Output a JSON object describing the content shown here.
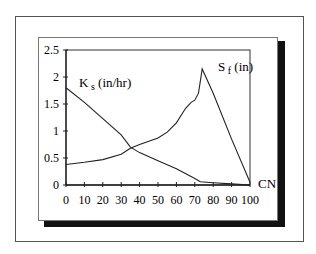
{
  "chart_data": {
    "type": "line",
    "title": "",
    "xlabel": "CN",
    "ylabel": "",
    "xlim": [
      0,
      100
    ],
    "ylim": [
      0,
      2.5
    ],
    "x_ticks": [
      "0",
      "10",
      "20",
      "30",
      "40",
      "50",
      "60",
      "70",
      "80",
      "90",
      "100"
    ],
    "y_ticks": [
      "0",
      "0.5",
      "1",
      "1.5",
      "2",
      "2.5"
    ],
    "grid": false,
    "legend": "inline labels",
    "series": [
      {
        "name": "Ks (in/hr)",
        "label_main": "K",
        "label_sub": "s",
        "label_unit": "(in/hr)",
        "x": [
          0,
          10,
          20,
          30,
          35,
          40,
          50,
          60,
          70,
          73,
          80,
          90,
          100
        ],
        "values": [
          1.8,
          1.53,
          1.23,
          0.93,
          0.7,
          0.6,
          0.45,
          0.3,
          0.12,
          0.06,
          0.04,
          0.02,
          0.0
        ]
      },
      {
        "name": "Sf (in)",
        "label_main": "S",
        "label_sub": "f",
        "label_unit": "(in)",
        "x": [
          0,
          10,
          20,
          30,
          35,
          40,
          50,
          55,
          60,
          65,
          68,
          70,
          72,
          74,
          80,
          90,
          100
        ],
        "values": [
          0.38,
          0.42,
          0.47,
          0.57,
          0.68,
          0.75,
          0.87,
          0.98,
          1.15,
          1.42,
          1.53,
          1.57,
          1.7,
          2.15,
          1.7,
          0.85,
          0.05
        ]
      }
    ]
  }
}
